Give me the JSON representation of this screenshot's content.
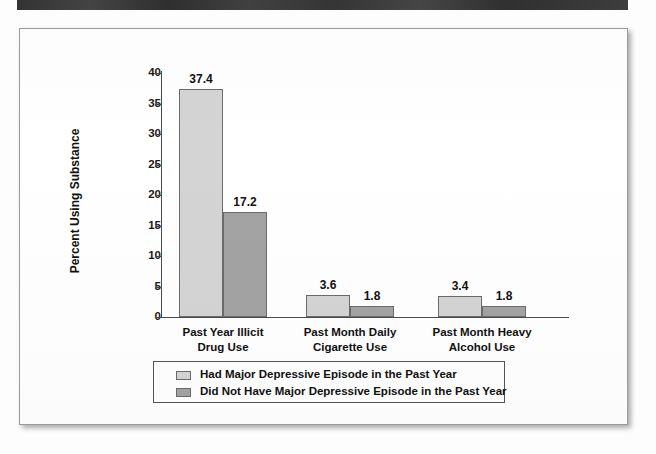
{
  "chart_data": {
    "type": "bar",
    "title": "",
    "xlabel": "",
    "ylabel": "Percent Using Substance",
    "ylim": [
      0,
      40
    ],
    "yticks": [
      "0",
      "5",
      "10",
      "15",
      "20",
      "25",
      "30",
      "35",
      "40"
    ],
    "ytick_values": [
      0,
      5,
      10,
      15,
      20,
      25,
      30,
      35,
      40
    ],
    "grid": false,
    "legend_position": "bottom",
    "categories": [
      "Past Year Illicit\nDrug Use",
      "Past Month Daily\nCigarette Use",
      "Past Month Heavy\nAlcohol Use"
    ],
    "category_lines": [
      [
        "Past Year Illicit",
        "Drug Use"
      ],
      [
        "Past Month Daily",
        "Cigarette Use"
      ],
      [
        "Past Month Heavy",
        "Alcohol Use"
      ]
    ],
    "series": [
      {
        "name": "Had Major Depressive Episode in the Past Year",
        "color": "#d4d4d4",
        "values": [
          37.4,
          3.6,
          3.4
        ],
        "labels": [
          "37.4",
          "3.6",
          "3.4"
        ]
      },
      {
        "name": "Did Not Have Major Depressive Episode in the Past Year",
        "color": "#a3a3a3",
        "values": [
          17.2,
          1.8,
          1.8
        ],
        "labels": [
          "17.2",
          "1.8",
          "1.8"
        ]
      }
    ]
  },
  "legend": {
    "items": [
      {
        "label": "Had Major Depressive Episode in the Past Year"
      },
      {
        "label": "Did Not Have Major Depressive Episode in the Past Year"
      }
    ]
  },
  "axis": {
    "y_title": "Percent Using Substance"
  },
  "colors": {
    "series0": "#d4d4d4",
    "series1": "#a3a3a3",
    "axis": "#4a4a4a",
    "banner": "#3a3a3a"
  }
}
